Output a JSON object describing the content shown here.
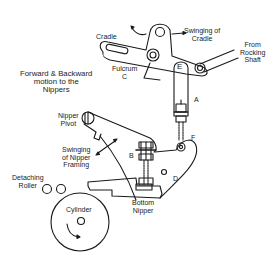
{
  "diagram": {
    "labels": {
      "cradle": "Cradle",
      "swinging_cradle_1": "Swinging of",
      "swinging_cradle_2": "Cradle",
      "from_rocking_1": "From",
      "from_rocking_2": "Rocking",
      "from_rocking_3": "Shaft",
      "forward_1": "Forward & Backward",
      "forward_2": "motion to the",
      "forward_3": "Nippers",
      "fulcrum_1": "Fulcrum",
      "fulcrum_2": "C",
      "point_e": "E",
      "point_a": "A",
      "nipper_pivot_1": "Nipper",
      "nipper_pivot_2": "Pivot",
      "point_f": "F",
      "swinging_nipper_1": "Swinging",
      "swinging_nipper_2": "of Nipper",
      "swinging_nipper_3": "Framing",
      "point_b": "B",
      "point_d": "D",
      "detaching_1": "Detaching",
      "detaching_2": "Roller",
      "cylinder": "Cylinder",
      "bottom_nipper_1": "Bottom",
      "bottom_nipper_2": "Nipper"
    },
    "colors": {
      "line": "#1a1a1a",
      "text": "#222222",
      "background": "#ffffff"
    }
  }
}
